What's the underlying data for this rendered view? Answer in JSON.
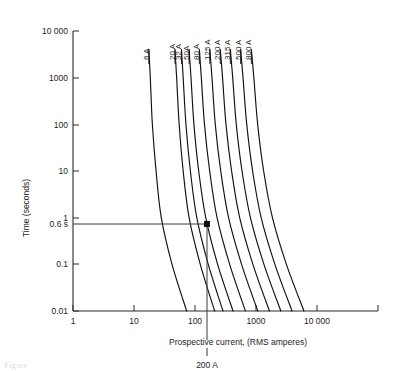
{
  "chart_data": {
    "type": "line",
    "title": "",
    "xlabel": "Prospective current, (RMS amperes)",
    "ylabel": "Time (seconds)",
    "xscale": "log",
    "yscale": "log",
    "xlim": [
      1,
      100000
    ],
    "ylim": [
      0.01,
      10000
    ],
    "grid": false,
    "legend_position": "inline-curve-labels",
    "x_ticks": [
      {
        "value": 1,
        "label": "1"
      },
      {
        "value": 10,
        "label": "10"
      },
      {
        "value": 100,
        "label": "100"
      },
      {
        "value": 1000,
        "label": "1000"
      },
      {
        "value": 10000,
        "label": "10 000"
      }
    ],
    "y_ticks": [
      {
        "value": 0.01,
        "label": "0.01"
      },
      {
        "value": 0.1,
        "label": "0.1"
      },
      {
        "value": 1,
        "label": "1"
      },
      {
        "value": 10,
        "label": "10"
      },
      {
        "value": 100,
        "label": "100"
      },
      {
        "value": 1000,
        "label": "1000"
      },
      {
        "value": 10000,
        "label": "10 000"
      }
    ],
    "series": [
      {
        "name": "6 A",
        "label": "6 A",
        "points": [
          [
            17.5,
            4000
          ],
          [
            18.5,
            1000
          ],
          [
            20,
            100
          ],
          [
            23,
            10
          ],
          [
            28,
            1
          ],
          [
            42,
            0.1
          ],
          [
            73,
            0.01
          ]
        ]
      },
      {
        "name": "20 A",
        "label": "20 A",
        "points": [
          [
            47,
            4000
          ],
          [
            50,
            1000
          ],
          [
            55,
            100
          ],
          [
            64,
            10
          ],
          [
            80,
            1
          ],
          [
            122,
            0.1
          ],
          [
            210,
            0.01
          ]
        ]
      },
      {
        "name": "32 A",
        "label": "32 A",
        "points": [
          [
            60,
            4000
          ],
          [
            64,
            1000
          ],
          [
            71,
            100
          ],
          [
            84,
            10
          ],
          [
            107,
            1
          ],
          [
            165,
            0.1
          ],
          [
            288,
            0.01
          ]
        ]
      },
      {
        "name": "50A",
        "label": "50A",
        "points": [
          [
            80,
            4000
          ],
          [
            86,
            1000
          ],
          [
            96,
            100
          ],
          [
            115,
            10
          ],
          [
            150,
            1
          ],
          [
            235,
            0.1
          ],
          [
            420,
            0.01
          ]
        ]
      },
      {
        "name": "80 A",
        "label": "80 A",
        "points": [
          [
            118,
            4000
          ],
          [
            127,
            1000
          ],
          [
            143,
            100
          ],
          [
            174,
            10
          ],
          [
            230,
            1
          ],
          [
            370,
            0.1
          ],
          [
            670,
            0.01
          ]
        ]
      },
      {
        "name": "125 A",
        "label": "125 A",
        "points": [
          [
            175,
            4000
          ],
          [
            190,
            1000
          ],
          [
            215,
            100
          ],
          [
            264,
            10
          ],
          [
            355,
            1
          ],
          [
            580,
            0.1
          ],
          [
            1070,
            0.01
          ]
        ]
      },
      {
        "name": "200 A",
        "label": "200 A",
        "points": [
          [
            260,
            4000
          ],
          [
            283,
            1000
          ],
          [
            322,
            100
          ],
          [
            398,
            10
          ],
          [
            540,
            1
          ],
          [
            890,
            0.1
          ],
          [
            1660,
            0.01
          ]
        ]
      },
      {
        "name": "315 A",
        "label": "315 A",
        "points": [
          [
            380,
            4000
          ],
          [
            415,
            1000
          ],
          [
            475,
            100
          ],
          [
            590,
            10
          ],
          [
            810,
            1
          ],
          [
            1350,
            0.1
          ],
          [
            2550,
            0.01
          ]
        ]
      },
      {
        "name": "500 A",
        "label": "500 A",
        "points": [
          [
            560,
            4000
          ],
          [
            613,
            1000
          ],
          [
            705,
            100
          ],
          [
            880,
            10
          ],
          [
            1215,
            1
          ],
          [
            2040,
            0.1
          ],
          [
            3900,
            0.01
          ]
        ]
      },
      {
        "name": "800 A",
        "label": "800 A",
        "points": [
          [
            840,
            4000
          ],
          [
            922,
            1000
          ],
          [
            1065,
            100
          ],
          [
            1335,
            10
          ],
          [
            1860,
            1
          ],
          [
            3150,
            0.1
          ],
          [
            6100,
            0.01
          ]
        ]
      }
    ],
    "annotations": [
      {
        "name": "operating-time-marker",
        "time_label": "0.6 s",
        "current_label": "200 A",
        "time_value": 0.6,
        "current_value": 200,
        "marker": "filled-square"
      }
    ]
  },
  "caption": {
    "text": "Figure"
  }
}
